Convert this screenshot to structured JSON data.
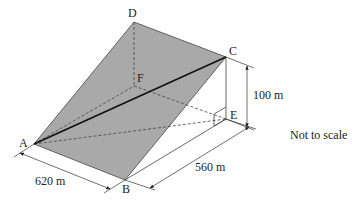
{
  "diagram": {
    "vertices": {
      "A": {
        "label": "A"
      },
      "B": {
        "label": "B"
      },
      "C": {
        "label": "C"
      },
      "D": {
        "label": "D"
      },
      "E": {
        "label": "E"
      },
      "F": {
        "label": "F"
      }
    },
    "dimensions": {
      "ab": "620 m",
      "be": "560 m",
      "ce": "100 m"
    },
    "note": "Not to scale",
    "colors": {
      "face": "#a9a9a9",
      "line": "#333333",
      "diagonal": "#111111"
    }
  }
}
